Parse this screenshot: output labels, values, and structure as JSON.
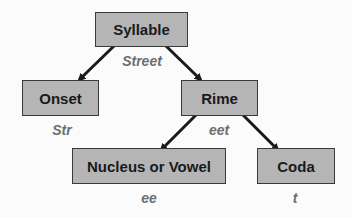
{
  "diagram": {
    "type": "tree",
    "nodes": [
      {
        "id": "syllable",
        "label": "Syllable",
        "example": "Street"
      },
      {
        "id": "onset",
        "label": "Onset",
        "example": "Str"
      },
      {
        "id": "rime",
        "label": "Rime",
        "example": "eet"
      },
      {
        "id": "nucleus",
        "label": "Nucleus or Vowel",
        "example": "ee"
      },
      {
        "id": "coda",
        "label": "Coda",
        "example": "t"
      }
    ],
    "edges": [
      {
        "from": "syllable",
        "to": "onset"
      },
      {
        "from": "syllable",
        "to": "rime"
      },
      {
        "from": "rime",
        "to": "nucleus"
      },
      {
        "from": "rime",
        "to": "coda"
      }
    ]
  },
  "colors": {
    "box_fill": "#b5b5b5",
    "box_border": "#3a3a3a",
    "example_text": "#6e6e6e",
    "arrow": "#1a1a1a"
  }
}
